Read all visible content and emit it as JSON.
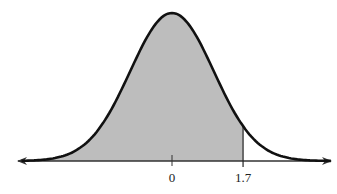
{
  "chart_data": {
    "type": "area",
    "title": "",
    "xlabel": "",
    "ylabel": "",
    "tick_labels": [
      "0",
      "1.7"
    ],
    "ticks": [
      0,
      1.7
    ],
    "mean": 0,
    "std": 1,
    "shaded_region": {
      "from": "-inf",
      "to": 1.7
    },
    "xlim": [
      -3.7,
      3.8
    ],
    "grid": false,
    "legend": null
  },
  "labels": {
    "mean": "0",
    "z": "1.7"
  },
  "colors": {
    "curve": "#111111",
    "shade": "#bdbdbd",
    "axis": "#333333"
  }
}
